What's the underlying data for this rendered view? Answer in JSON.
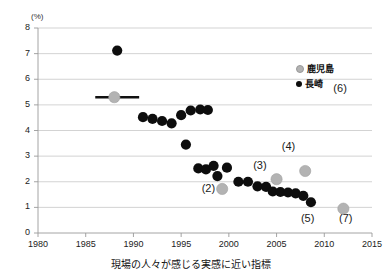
{
  "chart_data": {
    "type": "scatter",
    "title": "",
    "xlabel": "",
    "ylabel": "",
    "unit_label": "(%)",
    "xlim": [
      1980,
      2015
    ],
    "ylim": [
      0,
      8
    ],
    "xticks": [
      1980,
      1985,
      1990,
      1995,
      2000,
      2005,
      2010,
      2015
    ],
    "yticks": [
      0,
      1,
      2,
      3,
      4,
      5,
      6,
      7,
      8
    ],
    "grid": "horizontal",
    "legend_position": "top-right",
    "series": [
      {
        "name": "鹿児島",
        "color": "#b3b3b3",
        "marker": "circle",
        "points": [
          {
            "x": 1988.0,
            "y": 5.3
          },
          {
            "x": 1999.3,
            "y": 1.72
          },
          {
            "x": 2005.0,
            "y": 2.1
          },
          {
            "x": 2008.0,
            "y": 2.42
          },
          {
            "x": 2012.0,
            "y": 0.95
          }
        ]
      },
      {
        "name": "長崎",
        "color": "#0d0d0d",
        "marker": "circle",
        "points": [
          {
            "x": 1988.3,
            "y": 7.12
          },
          {
            "x": 1991.0,
            "y": 4.52
          },
          {
            "x": 1992.0,
            "y": 4.45
          },
          {
            "x": 1993.0,
            "y": 4.37
          },
          {
            "x": 1994.0,
            "y": 4.28
          },
          {
            "x": 1995.0,
            "y": 4.6
          },
          {
            "x": 1996.0,
            "y": 4.78
          },
          {
            "x": 1997.0,
            "y": 4.82
          },
          {
            "x": 1997.8,
            "y": 4.8
          },
          {
            "x": 1995.5,
            "y": 3.45
          },
          {
            "x": 1996.8,
            "y": 2.52
          },
          {
            "x": 1997.6,
            "y": 2.48
          },
          {
            "x": 1998.4,
            "y": 2.62
          },
          {
            "x": 1998.8,
            "y": 2.22
          },
          {
            "x": 1999.8,
            "y": 2.55
          },
          {
            "x": 2001.0,
            "y": 2.0
          },
          {
            "x": 2002.0,
            "y": 2.0
          },
          {
            "x": 2003.0,
            "y": 1.82
          },
          {
            "x": 2003.9,
            "y": 1.8
          },
          {
            "x": 2004.6,
            "y": 1.62
          },
          {
            "x": 2005.4,
            "y": 1.6
          },
          {
            "x": 2006.2,
            "y": 1.58
          },
          {
            "x": 2007.0,
            "y": 1.55
          },
          {
            "x": 2007.8,
            "y": 1.45
          },
          {
            "x": 2008.6,
            "y": 1.2
          }
        ],
        "reference_line": {
          "x_start": 1986.0,
          "x_end": 1990.6,
          "y": 5.3
        }
      }
    ],
    "annotations": [
      {
        "text": "(2)",
        "x": 1998.2,
        "y": 1.72
      },
      {
        "text": "(3)",
        "x": 2003.6,
        "y": 2.62
      },
      {
        "text": "(4)",
        "x": 2006.6,
        "y": 3.35
      },
      {
        "text": "(5)",
        "x": 2008.6,
        "y": 0.55
      },
      {
        "text": "(6)",
        "x": 2012.0,
        "y": 5.62
      },
      {
        "text": "(7)",
        "x": 2012.6,
        "y": 0.55
      }
    ]
  },
  "legend": {
    "items": [
      {
        "label": "鹿児島",
        "color": "#b3b3b3"
      },
      {
        "label": "長崎",
        "color": "#0d0d0d"
      }
    ]
  },
  "caption": {
    "text": "現場の人々が感じる実感に近い指標"
  }
}
